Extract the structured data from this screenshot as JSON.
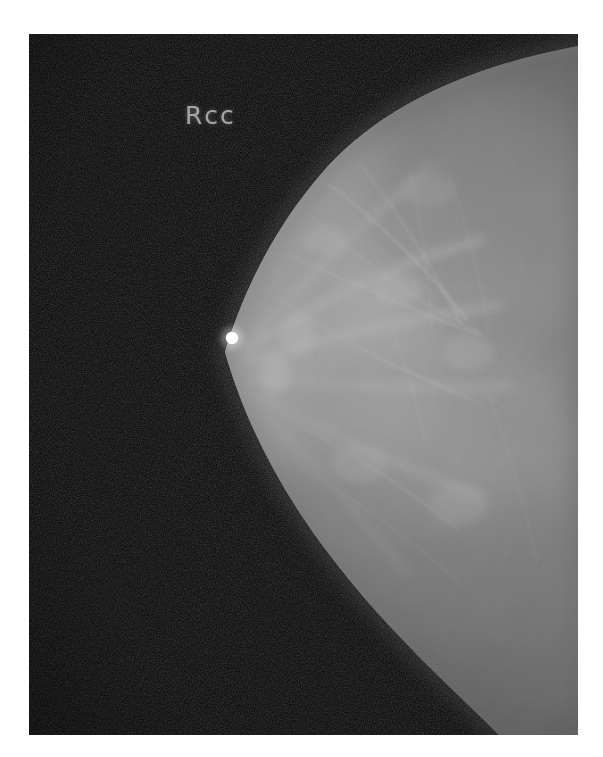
{
  "image": {
    "modality": "mammography",
    "view_label": "Rcc",
    "laterality": "R",
    "projection": "cc",
    "film_background_color": "#050505",
    "page_background_color": "#ffffff",
    "tissue_color": "#9a9a9a",
    "marker_color": "#ffffff",
    "label_color": "#b9b9b9",
    "film": {
      "x": 29,
      "y": 34,
      "width": 549,
      "height": 701
    },
    "canvas": {
      "width": 603,
      "height": 757
    },
    "annotations": [
      {
        "name": "nipple-marker",
        "kind": "radiopaque-bb",
        "x": 232,
        "y": 338,
        "radius": 6,
        "brightness": "#ffffff"
      }
    ],
    "label_position": {
      "x": 185,
      "y": 101
    }
  }
}
